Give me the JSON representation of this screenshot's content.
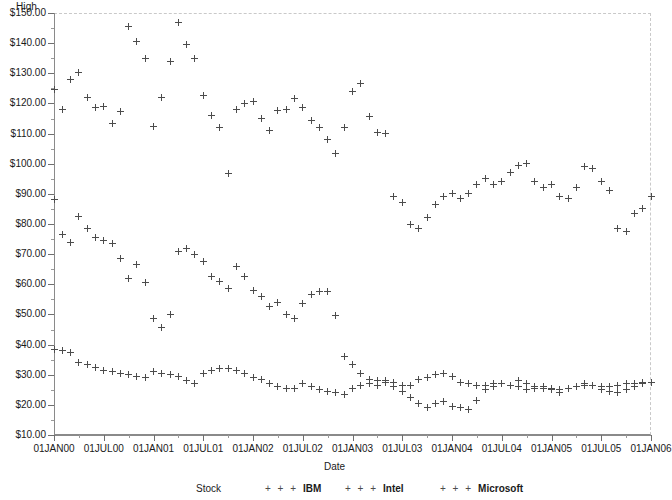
{
  "chart_data": {
    "type": "scatter",
    "title": "",
    "xlabel": "Date",
    "ylabel": "High",
    "grid": false,
    "legend_position": "bottom",
    "legend_title": "Stock",
    "ylim": [
      10,
      150
    ],
    "ytick_labels": [
      "$150.00",
      "$140.00",
      "$130.00",
      "$120.00",
      "$110.00",
      "$100.00",
      "$90.00",
      "$80.00",
      "$70.00",
      "$60.00",
      "$50.00",
      "$40.00",
      "$30.00",
      "$20.00",
      "$10.00"
    ],
    "ytick_values": [
      150,
      140,
      130,
      120,
      110,
      100,
      90,
      80,
      70,
      60,
      50,
      40,
      30,
      20,
      10
    ],
    "xtick_labels": [
      "01JAN00",
      "01JUL00",
      "01JAN01",
      "01JUL01",
      "01JAN02",
      "01JUL02",
      "01JAN03",
      "01JUL03",
      "01JAN04",
      "01JUL04",
      "01JAN05",
      "01JUL05",
      "01JAN06"
    ],
    "xlim": [
      "01JAN00",
      "01JAN06"
    ],
    "marker": "plus",
    "marker_color": "#4c4c4c",
    "series": [
      {
        "name": "IBM",
        "x": [
          0,
          1,
          2,
          3,
          4,
          5,
          6,
          7,
          8,
          9,
          10,
          11,
          12,
          13,
          14,
          15,
          16,
          17,
          18,
          19,
          20,
          21,
          22,
          23,
          24,
          25,
          26,
          27,
          28,
          29,
          30,
          31,
          32,
          33,
          34,
          35,
          36,
          37,
          38,
          39,
          40,
          41,
          42,
          43,
          44,
          45,
          46,
          47,
          48,
          49,
          50,
          51,
          52,
          53,
          54,
          55,
          56,
          57,
          58,
          59,
          60,
          61,
          62,
          63,
          64,
          65,
          66,
          67,
          68,
          69,
          70,
          71,
          72
        ],
        "values": [
          124.7,
          118.0,
          128.0,
          130.2,
          122.0,
          118.6,
          119.0,
          113.5,
          117.3,
          145.5,
          140.7,
          134.8,
          112.5,
          122.0,
          134.0,
          146.8,
          139.4,
          135.0,
          122.5,
          116.0,
          112.0,
          96.8,
          118.0,
          120.0,
          120.5,
          115.0,
          111.0,
          117.6,
          118.1,
          121.5,
          118.6,
          114.5,
          112.0,
          108.0,
          103.5,
          112.0,
          124.0,
          126.5,
          115.5,
          110.5,
          110.0,
          89.0,
          87.0,
          80.0,
          78.5,
          82.0,
          86.5,
          89.0,
          90.0,
          88.5,
          90.0,
          93.0,
          95.0,
          93.0,
          94.0,
          97.0,
          99.5,
          100.0,
          94.0,
          92.0,
          93.0,
          89.0,
          88.5,
          92.0,
          99.0,
          98.5,
          94.0,
          91.0,
          78.5,
          77.5,
          83.5,
          85.0,
          89.0
        ]
      },
      {
        "name": "Intel",
        "x": [
          0,
          1,
          2,
          3,
          4,
          5,
          6,
          7,
          8,
          9,
          10,
          11,
          12,
          13,
          14,
          15,
          16,
          17,
          18,
          19,
          20,
          21,
          22,
          23,
          24,
          25,
          26,
          27,
          28,
          29,
          30,
          31,
          32,
          33,
          34,
          35,
          36,
          37,
          38,
          39,
          40,
          41,
          42,
          43,
          44,
          45,
          46,
          47,
          48,
          49,
          50,
          51,
          52,
          53,
          54,
          55,
          56,
          57,
          58,
          59,
          60,
          61,
          62,
          63,
          64,
          65,
          66,
          67,
          68,
          69,
          70,
          71,
          72
        ],
        "values": [
          88.0,
          76.5,
          74.0,
          82.5,
          78.5,
          75.5,
          74.5,
          73.5,
          68.5,
          62.0,
          66.5,
          60.5,
          48.5,
          45.5,
          50.0,
          71.0,
          72.0,
          70.0,
          67.5,
          62.5,
          61.0,
          58.5,
          66.0,
          62.5,
          58.0,
          56.0,
          52.5,
          54.0,
          50.0,
          48.5,
          53.5,
          56.5,
          57.5,
          57.5,
          49.5,
          36.0,
          33.5,
          30.5,
          28.5,
          28.0,
          27.5,
          26.0,
          24.5,
          22.5,
          20.5,
          19.0,
          20.5,
          21.0,
          19.5,
          19.0,
          18.5,
          21.5,
          25.0,
          26.0,
          27.0,
          26.5,
          28.0,
          27.0,
          26.0,
          25.5,
          25.0,
          24.0,
          25.5,
          26.0,
          27.0,
          26.5,
          25.0,
          24.5,
          24.0,
          25.0,
          26.0,
          27.0,
          27.5
        ]
      },
      {
        "name": "Microsoft",
        "x": [
          0,
          1,
          2,
          3,
          4,
          5,
          6,
          7,
          8,
          9,
          10,
          11,
          12,
          13,
          14,
          15,
          16,
          17,
          18,
          19,
          20,
          21,
          22,
          23,
          24,
          25,
          26,
          27,
          28,
          29,
          30,
          31,
          32,
          33,
          34,
          35,
          36,
          37,
          38,
          39,
          40,
          41,
          42,
          43,
          44,
          45,
          46,
          47,
          48,
          49,
          50,
          51,
          52,
          53,
          54,
          55,
          56,
          57,
          58,
          59,
          60,
          61,
          62,
          63,
          64,
          65,
          66,
          67,
          68,
          69,
          70,
          71,
          72
        ],
        "values": [
          38.5,
          38.0,
          37.5,
          34.0,
          33.5,
          32.5,
          31.5,
          31.0,
          30.5,
          30.0,
          29.5,
          29.0,
          31.0,
          30.5,
          30.0,
          29.5,
          28.0,
          27.0,
          30.5,
          31.5,
          32.0,
          32.0,
          31.5,
          30.5,
          29.0,
          28.5,
          27.0,
          26.0,
          25.5,
          25.5,
          27.0,
          26.0,
          25.0,
          24.5,
          24.0,
          23.5,
          25.5,
          26.5,
          27.0,
          26.5,
          28.0,
          27.5,
          26.5,
          26.5,
          28.5,
          29.0,
          30.0,
          30.5,
          29.5,
          27.5,
          27.0,
          26.5,
          26.5,
          27.0,
          27.0,
          26.5,
          26.0,
          25.0,
          25.5,
          26.0,
          25.5,
          25.0,
          25.5,
          26.0,
          26.5,
          26.5,
          26.0,
          26.0,
          26.5,
          27.0,
          27.0,
          27.5,
          27.5
        ]
      }
    ]
  },
  "axes": {
    "y_title": "High",
    "x_title": "Date"
  },
  "legend": {
    "title": "Stock",
    "symbol": "+ + +",
    "entries": [
      {
        "label": "IBM"
      },
      {
        "label": "Intel"
      },
      {
        "label": "Microsoft"
      }
    ]
  }
}
